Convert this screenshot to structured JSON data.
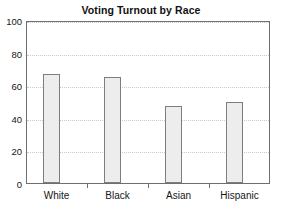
{
  "chart_data": {
    "type": "bar",
    "title": "Voting Turnout by Race",
    "xlabel": "",
    "ylabel": "",
    "categories": [
      "White",
      "Black",
      "Asian",
      "Hispanic"
    ],
    "values": [
      67,
      65,
      47.5,
      50
    ],
    "series": [
      {
        "name": "Voting Turnout",
        "values": [
          67,
          65,
          47.5,
          50
        ]
      }
    ],
    "ylim": [
      0,
      100
    ],
    "yticks": [
      0,
      20,
      40,
      60,
      80,
      100
    ],
    "ytick_labels": [
      "0",
      "20",
      "40",
      "60",
      "80",
      "100"
    ],
    "grid": true,
    "grid_axis": "y",
    "grid_style": "dotted",
    "legend": false,
    "legend_position": "none",
    "bar_fill_color": "#ededed",
    "bar_edge_color": "#7d7d7d",
    "frame_color": "#6e6e6e",
    "gridline_color": "#c9c9c9",
    "background_color": "#ffffff",
    "annotations": []
  }
}
